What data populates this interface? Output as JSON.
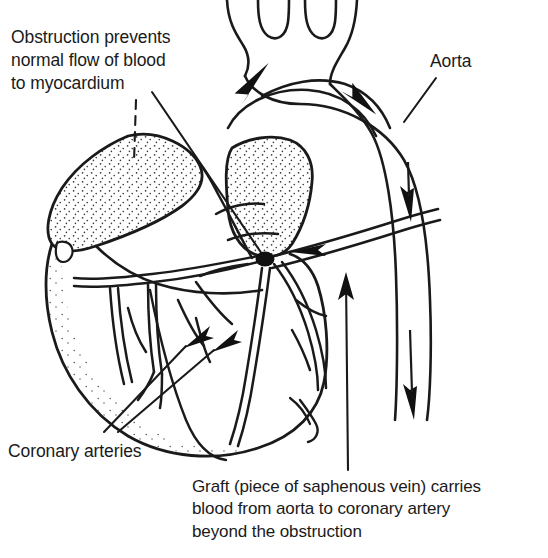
{
  "figure": {
    "type": "medical-line-drawing",
    "background_color": "#ffffff",
    "ink_color": "#1a1a1a",
    "stipple_color": "#3a3a3a"
  },
  "labels": {
    "obstruction": "Obstruction prevents\nnormal flow of blood\nto myocardium",
    "aorta": "Aorta",
    "coronary_arteries": "Coronary arteries",
    "graft_caption": "Graft (piece of saphenous vein) carries\nblood from aorta to coronary artery\nbeyond the obstruction"
  },
  "anatomy": {
    "parts": [
      "aortic-arch",
      "ascending-aorta",
      "descending-aorta",
      "brachiocephalic-branches",
      "left-atrial-appendage",
      "right-atrium",
      "left-ventricle",
      "right-ventricle",
      "coronary-artery-tree",
      "saphenous-vein-graft",
      "obstruction-plaque"
    ],
    "obstruction_marker": {
      "shape": "filled-ellipse",
      "x": 265,
      "y": 259,
      "rx": 9,
      "ry": 7,
      "color": "#111111"
    },
    "flow_arrows": [
      {
        "name": "ascending-aorta-flow",
        "direction": "up-right"
      },
      {
        "name": "arch-descending-flow",
        "direction": "down-right"
      },
      {
        "name": "descending-aorta-flow-upper",
        "direction": "down"
      },
      {
        "name": "descending-aorta-flow-lower",
        "direction": "down"
      },
      {
        "name": "graft-flow",
        "direction": "left"
      }
    ],
    "leader_lines": [
      {
        "name": "obstruction-leader",
        "from_label": "obstruction",
        "to": "obstruction-plaque"
      },
      {
        "name": "myocardium-dashed-leader",
        "from_label": "obstruction",
        "to": "myocardium",
        "style": "dashed"
      },
      {
        "name": "aorta-leader",
        "from_label": "aorta",
        "to": "descending-aorta"
      },
      {
        "name": "coronary-leader-upper",
        "from_label": "coronary_arteries",
        "to": "coronary-branch-left"
      },
      {
        "name": "coronary-leader-lower",
        "from_label": "coronary_arteries",
        "to": "coronary-branch-mid"
      },
      {
        "name": "graft-leader",
        "from_label": "graft_caption",
        "to": "saphenous-vein-graft"
      }
    ]
  }
}
